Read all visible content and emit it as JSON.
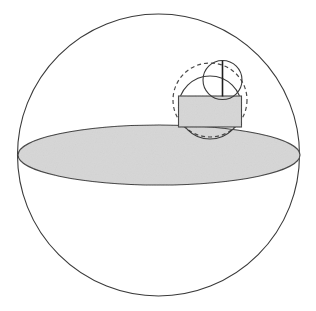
{
  "figure": {
    "canvas": {
      "width": 316,
      "height": 311,
      "background": "#ffffff"
    },
    "colors": {
      "stroke": "#3a3a3a",
      "fill_gray": "#d6d6d6",
      "fill_white": "#ffffff",
      "dashed_stroke": "#4a4a4a"
    },
    "shapes": [
      {
        "name": "outer-sphere-circle",
        "type": "circle",
        "label": "Outer sphere outline",
        "cx": 158.5,
        "cy": 155.0,
        "r": 141.0,
        "stroke": "#3a3a3a",
        "stroke_width": 1.1,
        "fill": "none",
        "dash": "none"
      },
      {
        "name": "equatorial-disk-ellipse",
        "type": "ellipse",
        "label": "Shaded equatorial disk",
        "cx": 159.0,
        "cy": 155.0,
        "rx": 141.0,
        "ry": 30.0,
        "stroke": "#3a3a3a",
        "stroke_width": 1.1,
        "fill": "#d6d6d6",
        "dash": "none"
      },
      {
        "name": "dashed-outer-small-sphere",
        "type": "circle",
        "label": "Dashed circumscribing small sphere",
        "cx": 210.0,
        "cy": 100.0,
        "r": 37.0,
        "stroke": "#4a4a4a",
        "stroke_width": 1.2,
        "fill": "none",
        "dash": "4,3"
      },
      {
        "name": "medium-solid-sphere",
        "type": "circle",
        "label": "Medium inscribed sphere",
        "cx": 210.0,
        "cy": 107.5,
        "r": 31.5,
        "stroke": "#3a3a3a",
        "stroke_width": 1.1,
        "fill": "none",
        "dash": "none"
      },
      {
        "name": "small-top-sphere",
        "type": "circle",
        "label": "Small upper sphere",
        "cx": 222.5,
        "cy": 80.0,
        "r": 19.5,
        "stroke": "#3a3a3a",
        "stroke_width": 1.1,
        "fill": "none",
        "dash": "none"
      },
      {
        "name": "inner-cylinder-rect",
        "type": "rect",
        "label": "Shaded inscribed cylinder body",
        "x": 178.5,
        "y": 96.0,
        "width": 63.0,
        "height": 31.0,
        "stroke": "#3a3a3a",
        "stroke_width": 1.1,
        "fill": "#d6d6d6",
        "dash": "none"
      },
      {
        "name": "vertical-axis-line",
        "type": "line",
        "label": "Vertical diameter axis of small sphere",
        "x1": 222.5,
        "y1": 60.8,
        "x2": 222.5,
        "y2": 96.5,
        "stroke": "#1e1e1e",
        "stroke_width": 1.6,
        "dash": "none"
      }
    ],
    "annotations": []
  }
}
